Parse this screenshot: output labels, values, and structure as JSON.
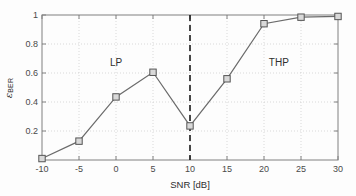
{
  "chart_data": {
    "type": "line",
    "title": "",
    "subtitle": "",
    "xlabel": "SNR [dB]",
    "ylabel": "ε_BER",
    "ylabel_base": "ε",
    "ylabel_sub": "BER",
    "x": [
      -10,
      -5,
      0,
      5,
      10,
      15,
      20,
      25,
      30
    ],
    "values": [
      0.01,
      0.13,
      0.435,
      0.605,
      0.235,
      0.56,
      0.94,
      0.985,
      0.99
    ],
    "series": [
      {
        "name": "",
        "x": [
          -10,
          -5,
          0,
          5,
          10,
          15,
          20,
          25,
          30
        ],
        "values": [
          0.01,
          0.13,
          0.435,
          0.605,
          0.235,
          0.56,
          0.94,
          0.985,
          0.99
        ],
        "marker": "square",
        "line_color": "#6b6b6b",
        "marker_face_color": "#d9d9d9",
        "marker_edge_color": "#555555"
      }
    ],
    "xlim": [
      -10,
      30
    ],
    "ylim": [
      0,
      1
    ],
    "xticks": [
      -10,
      -5,
      0,
      5,
      10,
      15,
      20,
      25,
      30
    ],
    "xtick_labels": [
      "-10",
      "-5",
      "0",
      "5",
      "10",
      "15",
      "20",
      "25",
      "30"
    ],
    "yticks": [
      0.2,
      0.4,
      0.6,
      0.8,
      1
    ],
    "ytick_labels": [
      "0.2",
      "0.4",
      "0.6",
      "0.8",
      "1"
    ],
    "grid": true,
    "grid_style": "dotted",
    "grid_color": "#c8c8c8",
    "legend": null,
    "legend_position": "none",
    "annotations": [
      {
        "text": "LP",
        "x": 0.0,
        "y": 0.67
      },
      {
        "text": "THP",
        "x": 22.0,
        "y": 0.67
      }
    ],
    "vlines": [
      {
        "x": 10,
        "style": "dashed",
        "color": "#1a1a1a",
        "width": 1.6
      }
    ],
    "axis_color": "#808080",
    "background_color": "#fdfdfd"
  }
}
